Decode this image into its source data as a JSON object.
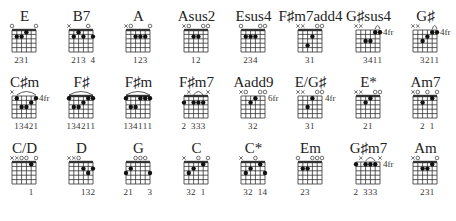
{
  "diagram": {
    "type": "guitar-chord-chart",
    "strings": 6,
    "frets_shown": 5,
    "legend": {
      "x": "muted string",
      "o": "open string",
      "dot": "fretted note",
      "arc": "barre",
      "fr": "starting fret position"
    },
    "rows": [
      [
        {
          "name": "E",
          "top": "o    oo",
          "fingers": "231",
          "finger_cols": [
            1,
            2,
            3
          ],
          "dots": [
            [
              1,
              2
            ],
            [
              2,
              2
            ],
            [
              3,
              1
            ]
          ],
          "barre": null,
          "nut": true,
          "fret_label": ""
        },
        {
          "name": "B7",
          "top": "x   o ",
          "fingers": "213 4",
          "finger_cols": [
            1,
            2,
            3,
            5
          ],
          "dots": [
            [
              1,
              2
            ],
            [
              2,
              1
            ],
            [
              3,
              2
            ],
            [
              5,
              2
            ]
          ],
          "barre": null,
          "nut": true,
          "fret_label": ""
        },
        {
          "name": "A",
          "top": "xo   o",
          "fingers": "123",
          "finger_cols": [
            2,
            3,
            4
          ],
          "dots": [
            [
              2,
              2
            ],
            [
              3,
              2
            ],
            [
              4,
              2
            ]
          ],
          "barre": null,
          "nut": true,
          "fret_label": ""
        },
        {
          "name": "Asus2",
          "top": "xo  oo",
          "fingers": "12",
          "finger_cols": [
            2,
            3
          ],
          "dots": [
            [
              2,
              2
            ],
            [
              3,
              2
            ]
          ],
          "barre": null,
          "nut": true,
          "fret_label": ""
        },
        {
          "name": "Esus4",
          "top": "o   oo",
          "fingers": "234",
          "finger_cols": [
            1,
            2,
            3
          ],
          "dots": [
            [
              1,
              2
            ],
            [
              2,
              2
            ],
            [
              3,
              2
            ]
          ],
          "barre": null,
          "nut": true,
          "fret_label": ""
        },
        {
          "name": "F♯m7add4",
          "top": "xx  oo",
          "fingers": "31",
          "finger_cols": [
            2,
            3
          ],
          "dots": [
            [
              2,
              4
            ],
            [
              3,
              2
            ]
          ],
          "barre": null,
          "nut": true,
          "fret_label": ""
        },
        {
          "name": "G♯sus4",
          "top": "xx    ",
          "fingers": "3411",
          "finger_cols": [
            2,
            3,
            4,
            5
          ],
          "dots": [
            [
              2,
              3
            ],
            [
              3,
              3
            ],
            [
              4,
              1
            ],
            [
              5,
              1
            ]
          ],
          "barre": [
            4,
            5
          ],
          "nut": false,
          "fret_label": "4fr"
        },
        {
          "name": "G♯",
          "top": "xx    ",
          "fingers": "3211",
          "finger_cols": [
            2,
            3,
            4,
            5
          ],
          "dots": [
            [
              2,
              3
            ],
            [
              3,
              2
            ],
            [
              4,
              1
            ],
            [
              5,
              1
            ]
          ],
          "barre": [
            4,
            5
          ],
          "nut": false,
          "fret_label": "4fr"
        }
      ],
      [
        {
          "name": "C♯m",
          "top": "x     ",
          "fingers": "13421",
          "finger_cols": [
            1,
            2,
            3,
            4,
            5
          ],
          "dots": [
            [
              1,
              1
            ],
            [
              2,
              3
            ],
            [
              3,
              3
            ],
            [
              4,
              2
            ],
            [
              5,
              1
            ]
          ],
          "barre": [
            1,
            5
          ],
          "nut": false,
          "fret_label": "4fr"
        },
        {
          "name": "F♯",
          "top": "      ",
          "fingers": "134211",
          "finger_cols": [
            0,
            1,
            2,
            3,
            4,
            5
          ],
          "dots": [
            [
              0,
              1
            ],
            [
              1,
              3
            ],
            [
              2,
              3
            ],
            [
              3,
              2
            ],
            [
              4,
              1
            ],
            [
              5,
              1
            ]
          ],
          "barre": [
            0,
            5
          ],
          "nut": true,
          "fret_label": ""
        },
        {
          "name": "F♯m",
          "top": "      ",
          "fingers": "134111",
          "finger_cols": [
            0,
            1,
            2,
            3,
            4,
            5
          ],
          "dots": [
            [
              0,
              1
            ],
            [
              1,
              3
            ],
            [
              2,
              3
            ],
            [
              3,
              1
            ],
            [
              4,
              1
            ],
            [
              5,
              1
            ]
          ],
          "barre": [
            0,
            5
          ],
          "nut": true,
          "fret_label": ""
        },
        {
          "name": "F♯m7",
          "top": " x   x",
          "fingers": "2 333",
          "finger_cols": [
            0,
            2,
            3,
            4
          ],
          "dots": [
            [
              0,
              2
            ],
            [
              2,
              2
            ],
            [
              3,
              2
            ],
            [
              4,
              2
            ]
          ],
          "barre": [
            2,
            4
          ],
          "nut": true,
          "fret_label": ""
        },
        {
          "name": "Aadd9",
          "top": "xo  oo",
          "fingers": "32",
          "finger_cols": [
            2,
            3
          ],
          "dots": [
            [
              2,
              2
            ],
            [
              3,
              1
            ]
          ],
          "barre": null,
          "nut": false,
          "fret_label": "6fr"
        },
        {
          "name": "E/G♯",
          "top": "xx  oo",
          "fingers": "31",
          "finger_cols": [
            2,
            3
          ],
          "dots": [
            [
              2,
              3
            ],
            [
              3,
              1
            ]
          ],
          "barre": null,
          "nut": false,
          "fret_label": "4fr"
        },
        {
          "name": "E*",
          "top": "xx  oo",
          "fingers": "21",
          "finger_cols": [
            2,
            3
          ],
          "dots": [
            [
              2,
              2
            ],
            [
              3,
              1
            ]
          ],
          "barre": null,
          "nut": true,
          "fret_label": ""
        },
        {
          "name": "Am7",
          "top": "xo o o",
          "fingers": "2 1",
          "finger_cols": [
            2,
            4
          ],
          "dots": [
            [
              2,
              2
            ],
            [
              4,
              1
            ]
          ],
          "barre": null,
          "nut": true,
          "fret_label": ""
        }
      ],
      [
        {
          "name": "C/D",
          "top": "xxoo o",
          "fingers": "1",
          "finger_cols": [
            4
          ],
          "dots": [
            [
              4,
              1
            ]
          ],
          "barre": null,
          "nut": true,
          "fret_label": ""
        },
        {
          "name": "D",
          "top": "xxo   ",
          "fingers": "132",
          "finger_cols": [
            3,
            4,
            5
          ],
          "dots": [
            [
              3,
              2
            ],
            [
              4,
              3
            ],
            [
              5,
              2
            ]
          ],
          "barre": null,
          "nut": true,
          "fret_label": ""
        },
        {
          "name": "G",
          "top": "  ooo ",
          "fingers": "21   3",
          "finger_cols": [
            0,
            1,
            5
          ],
          "dots": [
            [
              0,
              3
            ],
            [
              1,
              2
            ],
            [
              5,
              3
            ]
          ],
          "barre": null,
          "nut": true,
          "fret_label": ""
        },
        {
          "name": "C",
          "top": "x  o o",
          "fingers": "32 1",
          "finger_cols": [
            1,
            2,
            4
          ],
          "dots": [
            [
              1,
              3
            ],
            [
              2,
              2
            ],
            [
              4,
              1
            ]
          ],
          "barre": null,
          "nut": true,
          "fret_label": ""
        },
        {
          "name": "C*",
          "top": "x  o  ",
          "fingers": "32 14",
          "finger_cols": [
            1,
            2,
            4,
            5
          ],
          "dots": [
            [
              1,
              3
            ],
            [
              2,
              2
            ],
            [
              4,
              1
            ],
            [
              5,
              3
            ]
          ],
          "barre": null,
          "nut": true,
          "fret_label": ""
        },
        {
          "name": "Em",
          "top": "o  ooo",
          "fingers": "23",
          "finger_cols": [
            1,
            2
          ],
          "dots": [
            [
              1,
              2
            ],
            [
              2,
              2
            ]
          ],
          "barre": null,
          "nut": true,
          "fret_label": ""
        },
        {
          "name": "G♯m7",
          "top": " x   x",
          "fingers": "2 333",
          "finger_cols": [
            0,
            2,
            3,
            4
          ],
          "dots": [
            [
              0,
              1
            ],
            [
              2,
              1
            ],
            [
              3,
              1
            ],
            [
              4,
              1
            ]
          ],
          "barre": [
            2,
            4
          ],
          "nut": false,
          "fret_label": "4fr"
        },
        {
          "name": "Am",
          "top": "xo   o",
          "fingers": "231",
          "finger_cols": [
            2,
            3,
            4
          ],
          "dots": [
            [
              2,
              2
            ],
            [
              3,
              2
            ],
            [
              4,
              1
            ]
          ],
          "barre": null,
          "nut": true,
          "fret_label": ""
        }
      ]
    ]
  },
  "labels": {
    "r0": [
      "E",
      "B7",
      "A",
      "Asus2",
      "Esus4",
      "F♯m7add4",
      "G♯sus4",
      "G♯"
    ],
    "r1": [
      "C♯m",
      "F♯",
      "F♯m",
      "F♯m7",
      "Aadd9",
      "E/G♯",
      "E*",
      "Am7"
    ],
    "r2": [
      "C/D",
      "D",
      "G",
      "C",
      "C*",
      "Em",
      "G♯m7",
      "Am"
    ]
  },
  "fingerings": {
    "r0": [
      "231",
      "213 4",
      "123",
      "12",
      "234",
      "31",
      "3411",
      "3211"
    ],
    "r1": [
      "13421",
      "134211",
      "134111",
      "2 333",
      "32",
      "31",
      "21",
      "2 1"
    ],
    "r2": [
      "1",
      "132",
      "21   3",
      "32 1",
      "32 14",
      "23",
      "2 333",
      "231"
    ]
  }
}
